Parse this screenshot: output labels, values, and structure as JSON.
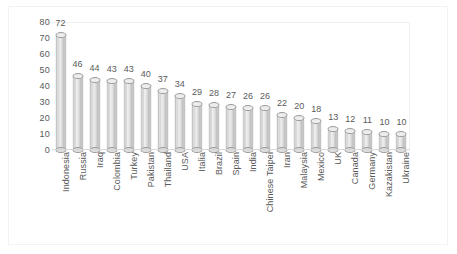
{
  "chart_data": {
    "type": "bar",
    "title": "",
    "subtitle": "",
    "xlabel": "",
    "ylabel": "",
    "ylim": [
      0,
      80
    ],
    "yticks": [
      0,
      10,
      20,
      30,
      40,
      50,
      60,
      70,
      80
    ],
    "grid": false,
    "legend": null,
    "legend_position": "none",
    "bar_style": "3d-cylinder",
    "data_labels": true,
    "label_rotation": -90,
    "categories": [
      "Indonesia",
      "Russia",
      "Iraq",
      "Colombia",
      "Turkey",
      "Pakistan",
      "Thailand",
      "USA",
      "Italia",
      "Brazil",
      "Spain",
      "India",
      "Chinese Taipei",
      "Iran",
      "Malaysia",
      "Mexico",
      "UK",
      "Canada",
      "Germany",
      "Kazakistan",
      "Ukraine"
    ],
    "values": [
      72,
      46,
      44,
      43,
      43,
      40,
      37,
      34,
      29,
      28,
      27,
      26,
      26,
      22,
      20,
      18,
      13,
      12,
      11,
      10,
      10
    ]
  },
  "colors": {
    "background": "#ffffff",
    "bar_fill": "#e2e2e2",
    "bar_outline": "#9a9a9a",
    "axis": "#d9d9d9",
    "text": "#5a5a5a",
    "frame": "#f2f2f2"
  }
}
